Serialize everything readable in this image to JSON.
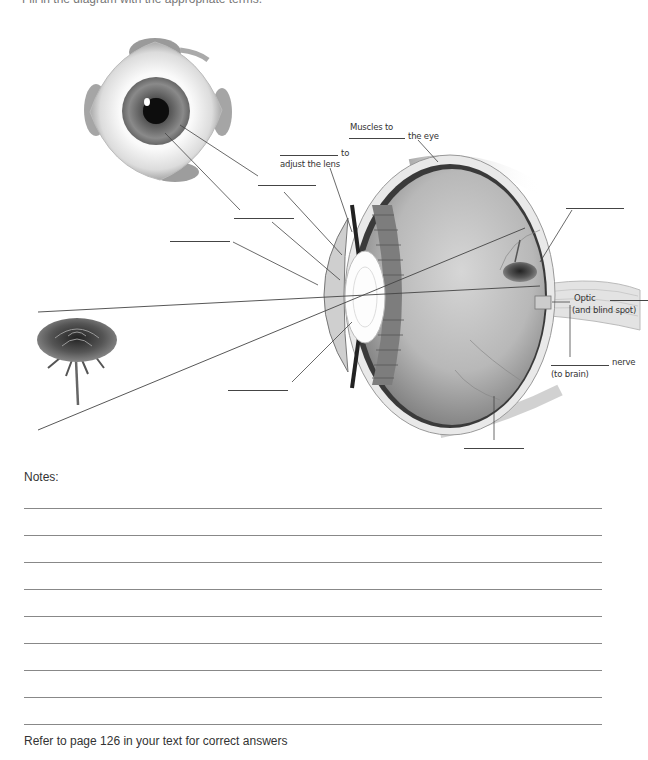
{
  "instructions": "Fill in the diagram with the appropriate terms.",
  "diagram": {
    "labels": {
      "muscles_to_prefix": "Muscles to",
      "muscles_to_suffix": "the eye",
      "to_adjust_suffix": "to",
      "to_adjust_line2": "adjust the lens",
      "optic": "Optic",
      "blind_spot": "(and blind spot)",
      "nerve": "nerve",
      "to_brain": "(to brain)"
    },
    "blank_count": 12,
    "images": [
      "eyeball-front-view",
      "eye-cross-section",
      "rose-object",
      "inverted-rose-on-retina"
    ]
  },
  "notes": {
    "title": "Notes:",
    "line_count": 9
  },
  "footer": "Refer to page 126 in your text for correct answers",
  "colors": {
    "ink": "#333333",
    "line": "#888888",
    "sclera": "#e6e6e6",
    "vitreous": "#b9b9b9"
  }
}
